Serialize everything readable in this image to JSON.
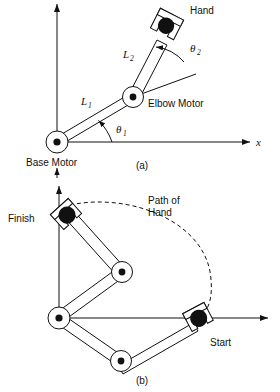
{
  "figure": {
    "panels": [
      {
        "id": "a",
        "caption": "(a)",
        "labels": {
          "hand": "Hand",
          "elbow_motor": "Elbow Motor",
          "base_motor": "Base Motor",
          "link1": "L",
          "link1_sub": "1",
          "link2": "L",
          "link2_sub": "2",
          "theta1": "θ",
          "theta1_sub": "1",
          "theta2": "θ",
          "theta2_sub": "2",
          "x_axis": "x"
        }
      },
      {
        "id": "b",
        "caption": "(b)",
        "labels": {
          "finish": "Finish",
          "start": "Start",
          "path_line1": "Path of",
          "path_line2": "Hand"
        }
      }
    ],
    "colors": {
      "ink": "#111111",
      "paper": "#ffffff"
    },
    "icons": {
      "arrow": "arrowhead-icon",
      "gripper": "gripper-icon",
      "joint": "revolute-joint-icon",
      "ball": "payload-ball-icon"
    }
  }
}
